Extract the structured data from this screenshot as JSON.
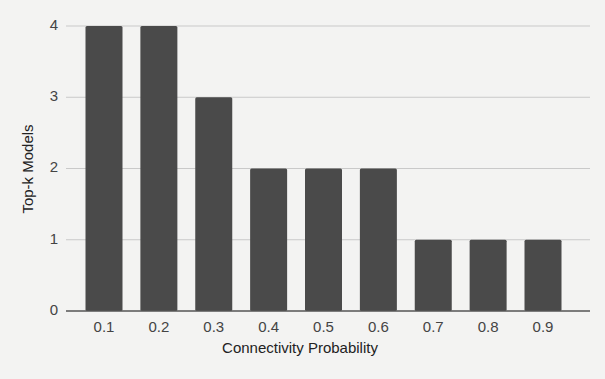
{
  "chart_data": {
    "type": "bar",
    "title": "",
    "xlabel": "Connectivity Probability",
    "ylabel": "Top-k Models",
    "categories": [
      "0.1",
      "0.2",
      "0.3",
      "0.4",
      "0.5",
      "0.6",
      "0.7",
      "0.8",
      "0.9"
    ],
    "values": [
      4,
      4,
      3,
      2,
      2,
      2,
      1,
      1,
      1
    ],
    "ylim": [
      0,
      4
    ],
    "yticks": [
      0,
      1,
      2,
      3,
      4
    ],
    "grid": true,
    "legend": null,
    "bar_color": "#4a4a4a"
  }
}
